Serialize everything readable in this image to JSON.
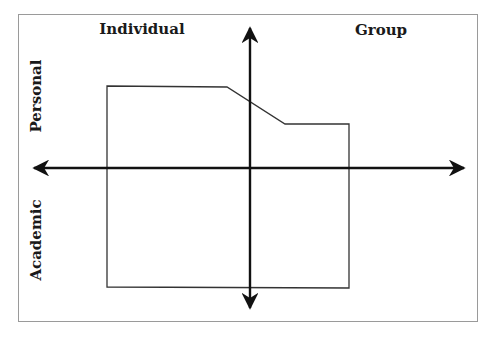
{
  "diagram": {
    "type": "quadrant",
    "labels": {
      "top_left": "Individual",
      "top_right": "Group",
      "left_upper": "Personal",
      "left_lower": "Academic"
    },
    "axes": {
      "horizontal": {
        "y": 168,
        "x_start": 34,
        "x_end": 464,
        "bidirectional": true
      },
      "vertical": {
        "x": 250,
        "y_start": 28,
        "y_end": 308,
        "bidirectional": true
      }
    },
    "region_polygon": [
      [
        107,
        86
      ],
      [
        227,
        87
      ],
      [
        285,
        124
      ],
      [
        349,
        124
      ],
      [
        349,
        288
      ],
      [
        107,
        287
      ]
    ],
    "colors": {
      "axis": "#111111",
      "region_stroke": "#333333",
      "frame": "#9a9a9a"
    }
  }
}
